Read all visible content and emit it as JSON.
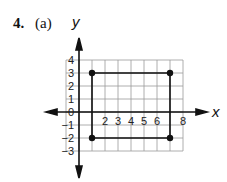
{
  "problem": {
    "number": "4.",
    "part": "(a)"
  },
  "chart_data": {
    "type": "scatter",
    "title": "",
    "xlabel": "x",
    "ylabel": "y",
    "xlim": [
      -1,
      8
    ],
    "ylim": [
      -3,
      4
    ],
    "grid": true,
    "x_tick_labels": [
      "2",
      "3",
      "4",
      "5",
      "6",
      "8"
    ],
    "y_tick_labels": [
      "4",
      "3",
      "2",
      "1",
      "0",
      "-1",
      "-2",
      "-3"
    ],
    "points": [
      {
        "x": 1,
        "y": 3
      },
      {
        "x": 7,
        "y": 3
      },
      {
        "x": 7,
        "y": -2
      },
      {
        "x": 1,
        "y": -2
      }
    ],
    "polygon": "rectangle connecting (1,3),(7,3),(7,-2),(1,-2)"
  }
}
